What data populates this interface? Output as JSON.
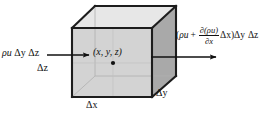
{
  "figure": {
    "type": "control-volume-diagram",
    "caption": ""
  },
  "labels": {
    "flux_in": {
      "rho_u": "ρu",
      "dy": "Δy",
      "dz": "Δz"
    },
    "dz": "Δz",
    "point": "(x, y, z)",
    "dx": "Δx",
    "dy": "Δy",
    "flux_out": {
      "open_paren": "(",
      "rho_u": "ρu",
      "plus": "+",
      "numerator": "∂(ρu)",
      "denominator": "∂x",
      "dx": "Δx",
      "close_paren": ")",
      "dy": "Δy",
      "dz": "Δz"
    }
  },
  "colors": {
    "face_top": "#e7e7e7",
    "face_front": "#d3d3d3",
    "face_right": "#a9a9a9",
    "edge": "#1d1d1d",
    "hidden_edge": "#b9b9b9",
    "arrow": "#111111",
    "background": "#ffffff",
    "dot": "#111111"
  },
  "geometry": {
    "front_face": [
      [
        72,
        28
      ],
      [
        152,
        28
      ],
      [
        152,
        97
      ],
      [
        72,
        97
      ]
    ],
    "top_face": [
      [
        72,
        28
      ],
      [
        95,
        6
      ],
      [
        176,
        6
      ],
      [
        152,
        28
      ]
    ],
    "right_face": [
      [
        152,
        28
      ],
      [
        176,
        6
      ],
      [
        176,
        76
      ],
      [
        152,
        97
      ]
    ],
    "center_dot": [
      113,
      63
    ],
    "arrow_in": {
      "x1": 47,
      "y1": 55,
      "x2": 89,
      "y2": 55
    },
    "arrow_out": {
      "x1": 151,
      "y1": 57,
      "x2": 216,
      "y2": 57
    }
  }
}
